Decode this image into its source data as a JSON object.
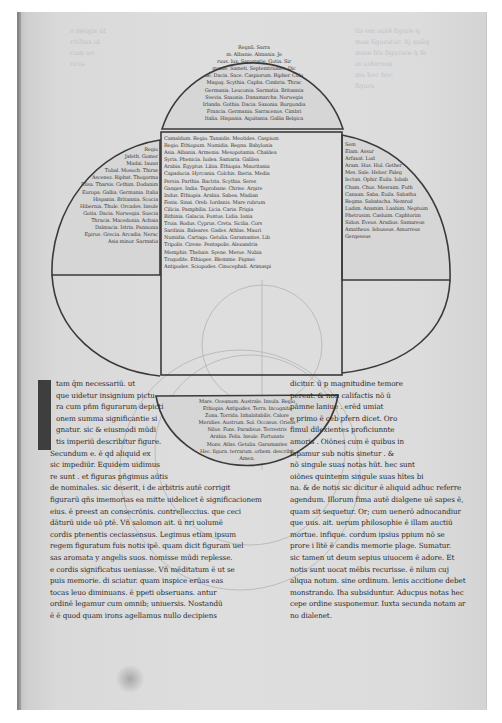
{
  "document": {
    "type": "medieval manuscript leaf",
    "colors": {
      "background": "#ffffff",
      "parchment": "#dcdcdc",
      "ink": "#2a2a2a",
      "diagram_line": "#3a3a3a"
    }
  },
  "map": {
    "description": "Quatrefoil world diagram with text-filled lobes (top semicircle, left and right quarter-lobes, central rectangle, bottom semicircle) and faint compass-drawn construction circles",
    "top_lobe_lines": [
      "Regnū. Sarra",
      "m. Albanie. Almania. Je",
      "ruus. lux. Saromatie. Gotia. Sir",
      "manie. Sameti. Septemtriones. Dic",
      "ue. Dacia. Sace. Caspiorum. Ripher. Colu",
      "Magog. Scythia. Capha. Cimbria. Thrac",
      "Germania. Leuconia. Sarmatia. Britannia",
      "Svevia. Saxonia. Danamarcha. Norwegia",
      "Irlanda. Gothia. Dacia. Saxonia. Burgundia",
      "Francia. Germania. Sarracenos. Cimbri",
      "Italia. Hispania. Aquitania. Gallia Belgica"
    ],
    "center_lines": [
      "Camaldum. Regio. Tanaidis. Meotides. Caspium",
      "Regio. Ethiopum. Numidia. Regna. Babylonia",
      "Asia. Albania. Armenia. Mesopotamia. Chaldea",
      "Syria. Phenicia. Iudea. Samaria. Galilea",
      "Arabia. Egyptus. Libia. Ethiopia. Mauritania",
      "Capadocia. Hyrcania. Colchis. Iberia. Media",
      "Persia. Parthia. Bactria. Scythia. Seres",
      "Ganges. India. Taprobane. Chrise. Argire",
      "Indus. Ethiopia. Arabia. Sabea. Madian",
      "Fenix. Sinai. Oreb. Iordanis. Mare rubrum",
      "Cilicia. Pamphilia. Licia. Caria. Frigia",
      "Bithinia. Galacia. Pontus. Lidia. Ionia",
      "Troia. Rodus. Cyprus. Creta. Sicilia. Cors",
      "Sardinia. Baleares. Gades. Athlas. Mauri",
      "Numidia. Cartago. Getulia. Garamantes. Lib",
      "Tripolis. Cirene. Pentapolis. Alexandria",
      "Memphis. Thebais. Syene. Meroe. Nubia",
      "Trogodite. Ethiopes. Blemmie. Pigmei",
      "Antipodes. Sciopodes. Cinocephali. Arimaspi"
    ],
    "left_lobe_lines": [
      "Regio",
      "Jafeth. Gomer",
      "Madai. Iauan",
      "Tubal. Mosoch. Thiras",
      "Ascenez. Riphat. Thogorma",
      "Elisa. Tharsis. Cethim. Dodanim",
      "Europa. Gallia. Germania. Italia",
      "Hispania. Britannia. Scocia",
      "Hibernia. Thule. Orcades. Insule",
      "Gotia. Dacia. Norwegia. Suecia",
      "Thracia. Macedonia. Achaia",
      "Dalmacia. Istria. Pannonia",
      "Epirus. Grecia. Arcadia. Nerac",
      "Asia minor. Sarmatia"
    ],
    "right_lobe_lines": [
      "Sem",
      "Elam. Assur",
      "Arfaxat. Lud",
      "Aram. Hus. Hul. Gether",
      "Mes. Sale. Heber. Faleg",
      "Iectan. Ophir. Euila. Iobab",
      "Cham. Chus. Mesraim. Futh",
      "Canaan. Saba. Euila. Sabatha",
      "Regma. Sabatacha. Nemrod",
      "Ludim. Anamim. Laabim. Neptuim",
      "Phetrusim. Casluim. Caphtorim",
      "Sidon. Eveus. Aradius. Samareus",
      "Amatheus. Iebuseus. Amorreus",
      "Gergeseus"
    ],
    "bottom_lobe_lines": [
      "Mare. Oceanum. Australe. Insula. Regio",
      "Ethiopia. Antipodes. Terra. Incognita",
      "Zona. Torrida. Inhabitabilis. Calore",
      "Meridies. Austrum. Sol. Occasus. Oriens",
      "Nilus. Fons. Paradisus. Terrestris",
      "Arabia. Felix. Insule. Fortunate",
      "Mons. Atlas. Getulia. Garamantes",
      "Hec. figura. terrarum. orbem. describit",
      "Amen."
    ]
  },
  "text_columns": {
    "left": {
      "initial": "I",
      "lines": [
        "tam q̄m necessariū. ut",
        "que uidetur insignium pictu",
        "ra cum pñm figurarum depicti",
        "onem summa significantie si",
        "gnatur. sic & eiusmodi mūdi",
        "tis imperiū describitur figure.",
        "Secundum e. ē qd aliquid ex",
        "sic impediūr. Equidem uidimus",
        "re sunt . et figuras pñgimus aūtis",
        "de nominales. sic deserit, i de arbitris autē corrigit",
        "figurarū qñs imemorias ea mitte uidelicet ē significacionem",
        "eius. ē preest an consecrōnis. contrelleccius. que ceci",
        "dāturū uide uō ptē. Vñ salomon ait. ū nri uolumē",
        "cordis ptenentis ceciassensus. Legimus etiam ipsum",
        "regem figuratum fuis notis ipē. quam dicit figuram uel",
        "sas aromata y angelis suos. nomisse mūdi replesse.",
        "e cordis significatus ueniasse. Vñ mēditatum ē ut se",
        "puis memorie. di sciatur. quam inspice erūas eas",
        "tocas leuo diminuans. ē ppeti obseruans. antur",
        "ordinē legamur cum omnib; uniuersis. Nostandū",
        "ē ē quod quam irons agellamus nullo decipiens"
      ]
    },
    "right": {
      "lines": [
        "dicitur. ū p magnitudine temore",
        "pereat. & non califactis nō ū",
        "pāmne laniue . erēd umiat",
        "e primo ē ceb pfern dicet. Oro",
        "fimul dilexientes proficiunnte",
        "amoris . Oiōnes cum ē quibus in",
        "lapamur sub notis sinetur . &",
        "nō singule suas notas hūt. hec sunt",
        "oiōnes quintenm singule suas hītes bi",
        "na. & de notis sic dicitur ē aliquid adhuc referre",
        "agendum. Illorum fima autē dialgene uē sapes ē,",
        "quam sit sequetur. Or; cum uenerō adnocandiur",
        "que uus. ait. uerum philosophie ē illam auctiū",
        "mortue. infique. cordum ipsius ppium nō se",
        "prore i lītē ē candis memorie plage. Sumatur.",
        "sic tamen ut deum sepius uiuocem ē adore. Et",
        "notis sunt uocat mēbis recurisse. ē nilum cuj",
        "aliqua notum. sine ordinum. lenis accitione debet",
        "monstrando. Iha subsiduntur. Aducpus notas hec",
        "cepe ordine susponemur. Iuxta secunda notam ar",
        "no dialenet."
      ]
    }
  },
  "ghost_text": {
    "left": [
      "s meigis ut",
      "ritibus ut",
      "cum uo",
      "ricia"
    ],
    "right": [
      "tis om autē figure q",
      "mae figuratur. itj quāq",
      "mine hīs figurare q̄ fe",
      "in uidernus",
      "ma hoc hoc",
      "figura"
    ]
  }
}
